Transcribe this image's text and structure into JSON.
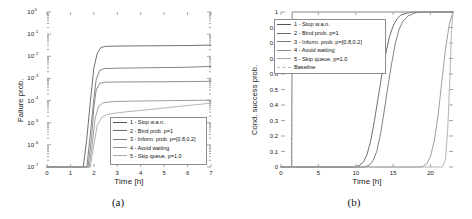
{
  "figure": {
    "panels": [
      {
        "caption": "(a)",
        "chart_data": {
          "type": "line",
          "title": "",
          "xlabel": "Time [h]",
          "ylabel": "Failure prob.",
          "xlim": [
            0,
            7
          ],
          "xticks": [
            0,
            1,
            2,
            3,
            4,
            5,
            6,
            7
          ],
          "xticklabels": [
            "0",
            "1",
            "2",
            "3",
            "4",
            "5",
            "6",
            "7"
          ],
          "yscale": "log",
          "ylim": [
            1e-07,
            1
          ],
          "yticks": [
            1,
            0.1,
            0.01,
            0.001,
            0.0001,
            1e-05,
            1e-06,
            1e-07
          ],
          "yticklabels": [
            "10^0",
            "10^-1",
            "10^-2",
            "10^-3",
            "10^-4",
            "10^-5",
            "10^-6",
            "10^-7"
          ],
          "grid": false,
          "legend_position": "lower right",
          "series": [
            {
              "name": "1 - Stop w.a.n.",
              "color": "#555555",
              "x": [
                0,
                1.55,
                1.7,
                1.85,
                2.0,
                2.15,
                2.3,
                2.5,
                3.0,
                4.0,
                5.0,
                6.0,
                7.0
              ],
              "y": [
                1e-07,
                1e-07,
                2e-06,
                9e-05,
                0.003,
                0.014,
                0.025,
                0.028,
                0.029,
                0.0295,
                0.03,
                0.0305,
                0.032
              ]
            },
            {
              "name": "2 - Bind prob. p=1",
              "color": "#6a6a6a",
              "x": [
                0,
                1.7,
                1.85,
                2.0,
                2.1,
                2.25,
                2.45,
                3.0,
                4.0,
                5.0,
                6.0,
                7.0
              ],
              "y": [
                1e-07,
                1e-07,
                3e-06,
                0.00012,
                0.0009,
                0.0023,
                0.0028,
                0.0029,
                0.003,
                0.0031,
                0.0032,
                0.0035
              ]
            },
            {
              "name": "3 - Inform. prob. p=[0.8,0.2]",
              "color": "#7c7c7c",
              "x": [
                0,
                1.75,
                1.9,
                2.0,
                2.1,
                2.25,
                2.5,
                3.0,
                4.0,
                5.0,
                6.0,
                7.0
              ],
              "y": [
                1e-07,
                1e-07,
                2e-06,
                5e-05,
                0.0003,
                0.0006,
                0.00068,
                0.00069,
                0.0007,
                0.00071,
                0.00072,
                0.00074
              ]
            },
            {
              "name": "4 - Avoid waiting",
              "color": "#8e8e8e",
              "x": [
                0,
                1.8,
                1.95,
                2.05,
                2.2,
                2.4,
                2.8,
                3.5,
                4.5,
                5.5,
                6.5,
                7.0
              ],
              "y": [
                1e-07,
                1e-07,
                1.5e-06,
                1.5e-05,
                5.5e-05,
                8e-05,
                9e-05,
                9.4e-05,
                9.7e-05,
                0.0001,
                0.000103,
                0.000105
              ]
            },
            {
              "name": "5 - Skip queue, p=1.0",
              "color": "#a8a8a8",
              "x": [
                0,
                1.85,
                2.0,
                2.15,
                2.35,
                2.6,
                3.0,
                3.5,
                4.0,
                5.0,
                6.0,
                7.0
              ],
              "y": [
                1e-07,
                1e-07,
                1e-06,
                8e-06,
                1.8e-05,
                2.4e-05,
                2.8e-05,
                3.2e-05,
                3.6e-05,
                4.6e-05,
                6e-05,
                7.6e-05
              ]
            }
          ]
        },
        "legend": [
          {
            "label": "1 - Stop w.a.n.",
            "color": "#555555",
            "dash": "solid"
          },
          {
            "label": "2 - Bind prob. p=1",
            "color": "#6a6a6a",
            "dash": "solid"
          },
          {
            "label": "3 - Inform. prob. p=[0.8,0.2]",
            "color": "#7c7c7c",
            "dash": "solid"
          },
          {
            "label": "4 - Avoid waiting",
            "color": "#8e8e8e",
            "dash": "solid"
          },
          {
            "label": "5 - Skip queue, p=1.0",
            "color": "#a8a8a8",
            "dash": "solid"
          }
        ]
      },
      {
        "caption": "(b)",
        "chart_data": {
          "type": "line",
          "title": "",
          "xlabel": "Time [h]",
          "ylabel": "Cond. success prob.",
          "xlim": [
            0,
            23
          ],
          "xticks": [
            0,
            5,
            10,
            15,
            20
          ],
          "xticklabels": [
            "0",
            "5",
            "10",
            "15",
            "20"
          ],
          "yscale": "linear",
          "ylim": [
            0,
            1
          ],
          "yticks": [
            0,
            0.1,
            0.2,
            0.3,
            0.4,
            0.5,
            0.6,
            0.7,
            0.8,
            0.9,
            1
          ],
          "yticklabels": [
            "0",
            "0.1",
            "0.2",
            "0.3",
            "0.4",
            "0.5",
            "0.6",
            "0.7",
            "0.8",
            "0.9",
            "1"
          ],
          "grid": false,
          "legend_position": "upper left",
          "series": [
            {
              "name": "1 - Stop w.a.n.",
              "color": "#555555",
              "x": [
                0,
                9.8,
                10.5,
                11.0,
                11.5,
                12.0,
                12.5,
                13.0,
                13.5,
                14.0,
                14.5,
                15.0,
                15.5,
                16.0,
                17.0,
                18.0,
                23.0
              ],
              "y": [
                0,
                0,
                0.01,
                0.03,
                0.08,
                0.17,
                0.3,
                0.45,
                0.6,
                0.73,
                0.84,
                0.91,
                0.955,
                0.98,
                0.995,
                1.0,
                1.0
              ]
            },
            {
              "name": "2 - Bind prob. p=1",
              "color": "#6a6a6a",
              "x": [
                0,
                11.0,
                11.8,
                12.3,
                12.8,
                13.3,
                13.8,
                14.3,
                14.8,
                15.3,
                15.8,
                16.3,
                17.0,
                18.0,
                19.0,
                23.0
              ],
              "y": [
                0,
                0,
                0.01,
                0.04,
                0.1,
                0.21,
                0.36,
                0.52,
                0.67,
                0.8,
                0.89,
                0.94,
                0.975,
                0.995,
                1.0,
                1.0
              ]
            },
            {
              "name": "3 - Inform. prob. p=[0.8,0.2]",
              "color": "#7c7c7c",
              "x": [
                0,
                1.4,
                1.45,
                1.5,
                23.0
              ],
              "y": [
                0,
                0,
                0.5,
                1.0,
                1.0
              ]
            },
            {
              "name": "4 - Avoid waiting",
              "color": "#8e8e8e",
              "x": [
                0,
                18.8,
                19.5,
                20.0,
                20.5,
                21.0,
                21.5,
                22.0,
                22.5,
                23.0
              ],
              "y": [
                0,
                0,
                0.02,
                0.07,
                0.17,
                0.33,
                0.55,
                0.76,
                0.92,
                1.0
              ]
            },
            {
              "name": "5 - Skip queue, p=1.0",
              "color": "#a8a8a8",
              "x": [
                0,
                21.6,
                22.0,
                22.3,
                22.6,
                22.8,
                23.0
              ],
              "y": [
                0,
                0,
                0.05,
                0.25,
                0.6,
                0.88,
                1.0
              ]
            },
            {
              "name": "Baseline",
              "color": "#b5b5b5",
              "dash": "dashed",
              "x": [
                1.5,
                1.5,
                23.0
              ],
              "y": [
                0,
                1.0,
                1.0
              ]
            }
          ]
        },
        "legend": [
          {
            "label": "1 - Stop w.a.n.",
            "color": "#555555",
            "dash": "solid"
          },
          {
            "label": "2 - Bind prob. p=1",
            "color": "#6a6a6a",
            "dash": "solid"
          },
          {
            "label": "3 - Inform. prob. p=[0.8,0.2]",
            "color": "#7c7c7c",
            "dash": "solid"
          },
          {
            "label": "4 - Avoid waiting",
            "color": "#8e8e8e",
            "dash": "solid"
          },
          {
            "label": "5 - Skip queue, p=1.0",
            "color": "#a8a8a8",
            "dash": "solid"
          },
          {
            "label": "Baseline",
            "color": "#b5b5b5",
            "dash": "dashed"
          }
        ]
      }
    ]
  }
}
